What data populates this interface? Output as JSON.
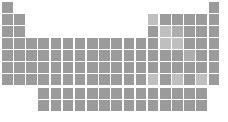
{
  "figure": {
    "name": "periodic-table-silhouette",
    "width": 228,
    "height": 122,
    "background_color": "#ffffff"
  },
  "palette": {
    "cell_default": "#9b9b9b",
    "cell_light": "#bfbfbf",
    "cell_mid": "#adadad",
    "cell_dark": "#8e8e8e",
    "background": "#ffffff"
  },
  "geometry": {
    "cell_size": 10.6,
    "cell_pitch_x": 12.15,
    "cell_pitch_y": 12.0,
    "origin_x": 2,
    "origin_y": 2,
    "f_block_origin_y": 88,
    "f_block_start_group": 4,
    "groups": 18,
    "periods": 7,
    "f_block_rows": 2,
    "f_block_columns": 14
  },
  "chart_data": {
    "type": "heatmap",
    "title": "",
    "xlabel": "",
    "ylabel": "",
    "grid": false,
    "legend": "none",
    "main_block": {
      "rows": [
        {
          "period": 1,
          "occupied_groups": [
            1,
            18
          ]
        },
        {
          "period": 2,
          "occupied_groups": [
            1,
            2,
            13,
            14,
            15,
            16,
            17,
            18
          ]
        },
        {
          "period": 3,
          "occupied_groups": [
            1,
            2,
            13,
            14,
            15,
            16,
            17,
            18
          ]
        },
        {
          "period": 4,
          "occupied_groups": [
            1,
            2,
            3,
            4,
            5,
            6,
            7,
            8,
            9,
            10,
            11,
            12,
            13,
            14,
            15,
            16,
            17,
            18
          ]
        },
        {
          "period": 5,
          "occupied_groups": [
            1,
            2,
            3,
            4,
            5,
            6,
            7,
            8,
            9,
            10,
            11,
            12,
            13,
            14,
            15,
            16,
            17,
            18
          ]
        },
        {
          "period": 6,
          "occupied_groups": [
            1,
            2,
            3,
            4,
            5,
            6,
            7,
            8,
            9,
            10,
            11,
            12,
            13,
            14,
            15,
            16,
            17,
            18
          ]
        },
        {
          "period": 7,
          "occupied_groups": [
            1,
            2,
            3,
            4,
            5,
            6,
            7,
            8,
            9,
            10,
            11,
            12,
            13,
            14,
            15,
            16,
            17,
            18
          ]
        }
      ]
    },
    "f_block": {
      "rows": [
        {
          "series": "lanthanides",
          "columns": 14
        },
        {
          "series": "actinides",
          "columns": 14
        }
      ]
    },
    "cells": [
      {
        "row": 1,
        "col": 1,
        "shade": "default"
      },
      {
        "row": 1,
        "col": 18,
        "shade": "default"
      },
      {
        "row": 2,
        "col": 1,
        "shade": "default"
      },
      {
        "row": 2,
        "col": 2,
        "shade": "default"
      },
      {
        "row": 2,
        "col": 13,
        "shade": "light"
      },
      {
        "row": 2,
        "col": 14,
        "shade": "default"
      },
      {
        "row": 2,
        "col": 15,
        "shade": "default"
      },
      {
        "row": 2,
        "col": 16,
        "shade": "default"
      },
      {
        "row": 2,
        "col": 17,
        "shade": "default"
      },
      {
        "row": 2,
        "col": 18,
        "shade": "default"
      },
      {
        "row": 3,
        "col": 1,
        "shade": "default"
      },
      {
        "row": 3,
        "col": 2,
        "shade": "default"
      },
      {
        "row": 3,
        "col": 13,
        "shade": "default"
      },
      {
        "row": 3,
        "col": 14,
        "shade": "light"
      },
      {
        "row": 3,
        "col": 15,
        "shade": "mid"
      },
      {
        "row": 3,
        "col": 16,
        "shade": "default"
      },
      {
        "row": 3,
        "col": 17,
        "shade": "default"
      },
      {
        "row": 3,
        "col": 18,
        "shade": "default"
      },
      {
        "row": 4,
        "col": 1,
        "shade": "default"
      },
      {
        "row": 4,
        "col": 2,
        "shade": "default"
      },
      {
        "row": 4,
        "col": 3,
        "shade": "default"
      },
      {
        "row": 4,
        "col": 4,
        "shade": "default"
      },
      {
        "row": 4,
        "col": 5,
        "shade": "default"
      },
      {
        "row": 4,
        "col": 6,
        "shade": "default"
      },
      {
        "row": 4,
        "col": 7,
        "shade": "default"
      },
      {
        "row": 4,
        "col": 8,
        "shade": "default"
      },
      {
        "row": 4,
        "col": 9,
        "shade": "default"
      },
      {
        "row": 4,
        "col": 10,
        "shade": "default"
      },
      {
        "row": 4,
        "col": 11,
        "shade": "default"
      },
      {
        "row": 4,
        "col": 12,
        "shade": "default"
      },
      {
        "row": 4,
        "col": 13,
        "shade": "default"
      },
      {
        "row": 4,
        "col": 14,
        "shade": "light"
      },
      {
        "row": 4,
        "col": 15,
        "shade": "light"
      },
      {
        "row": 4,
        "col": 16,
        "shade": "default"
      },
      {
        "row": 4,
        "col": 17,
        "shade": "default"
      },
      {
        "row": 4,
        "col": 18,
        "shade": "default"
      },
      {
        "row": 5,
        "col": 1,
        "shade": "default"
      },
      {
        "row": 5,
        "col": 2,
        "shade": "default"
      },
      {
        "row": 5,
        "col": 3,
        "shade": "default"
      },
      {
        "row": 5,
        "col": 4,
        "shade": "default"
      },
      {
        "row": 5,
        "col": 5,
        "shade": "default"
      },
      {
        "row": 5,
        "col": 6,
        "shade": "default"
      },
      {
        "row": 5,
        "col": 7,
        "shade": "default"
      },
      {
        "row": 5,
        "col": 8,
        "shade": "default"
      },
      {
        "row": 5,
        "col": 9,
        "shade": "default"
      },
      {
        "row": 5,
        "col": 10,
        "shade": "default"
      },
      {
        "row": 5,
        "col": 11,
        "shade": "default"
      },
      {
        "row": 5,
        "col": 12,
        "shade": "default"
      },
      {
        "row": 5,
        "col": 13,
        "shade": "default"
      },
      {
        "row": 5,
        "col": 14,
        "shade": "default"
      },
      {
        "row": 5,
        "col": 15,
        "shade": "default"
      },
      {
        "row": 5,
        "col": 16,
        "shade": "mid"
      },
      {
        "row": 5,
        "col": 17,
        "shade": "default"
      },
      {
        "row": 5,
        "col": 18,
        "shade": "default"
      },
      {
        "row": 6,
        "col": 1,
        "shade": "default"
      },
      {
        "row": 6,
        "col": 2,
        "shade": "default"
      },
      {
        "row": 6,
        "col": 3,
        "shade": "default"
      },
      {
        "row": 6,
        "col": 4,
        "shade": "default"
      },
      {
        "row": 6,
        "col": 5,
        "shade": "default"
      },
      {
        "row": 6,
        "col": 6,
        "shade": "default"
      },
      {
        "row": 6,
        "col": 7,
        "shade": "default"
      },
      {
        "row": 6,
        "col": 8,
        "shade": "default"
      },
      {
        "row": 6,
        "col": 9,
        "shade": "default"
      },
      {
        "row": 6,
        "col": 10,
        "shade": "default"
      },
      {
        "row": 6,
        "col": 11,
        "shade": "default"
      },
      {
        "row": 6,
        "col": 12,
        "shade": "default"
      },
      {
        "row": 6,
        "col": 13,
        "shade": "default"
      },
      {
        "row": 6,
        "col": 14,
        "shade": "default"
      },
      {
        "row": 6,
        "col": 15,
        "shade": "default"
      },
      {
        "row": 6,
        "col": 16,
        "shade": "default"
      },
      {
        "row": 6,
        "col": 17,
        "shade": "default"
      },
      {
        "row": 6,
        "col": 18,
        "shade": "default"
      },
      {
        "row": 7,
        "col": 1,
        "shade": "default"
      },
      {
        "row": 7,
        "col": 2,
        "shade": "default"
      },
      {
        "row": 7,
        "col": 3,
        "shade": "default"
      },
      {
        "row": 7,
        "col": 4,
        "shade": "default"
      },
      {
        "row": 7,
        "col": 5,
        "shade": "default"
      },
      {
        "row": 7,
        "col": 6,
        "shade": "default"
      },
      {
        "row": 7,
        "col": 7,
        "shade": "default"
      },
      {
        "row": 7,
        "col": 8,
        "shade": "default"
      },
      {
        "row": 7,
        "col": 9,
        "shade": "default"
      },
      {
        "row": 7,
        "col": 10,
        "shade": "default"
      },
      {
        "row": 7,
        "col": 11,
        "shade": "default"
      },
      {
        "row": 7,
        "col": 12,
        "shade": "default"
      },
      {
        "row": 7,
        "col": 13,
        "shade": "light"
      },
      {
        "row": 7,
        "col": 14,
        "shade": "default"
      },
      {
        "row": 7,
        "col": 15,
        "shade": "light"
      },
      {
        "row": 7,
        "col": 16,
        "shade": "default"
      },
      {
        "row": 7,
        "col": 17,
        "shade": "light"
      },
      {
        "row": 7,
        "col": 18,
        "shade": "default"
      }
    ],
    "f_cells": [
      {
        "row": 1,
        "col": 1,
        "shade": "default"
      },
      {
        "row": 1,
        "col": 2,
        "shade": "default"
      },
      {
        "row": 1,
        "col": 3,
        "shade": "default"
      },
      {
        "row": 1,
        "col": 4,
        "shade": "default"
      },
      {
        "row": 1,
        "col": 5,
        "shade": "default"
      },
      {
        "row": 1,
        "col": 6,
        "shade": "default"
      },
      {
        "row": 1,
        "col": 7,
        "shade": "default"
      },
      {
        "row": 1,
        "col": 8,
        "shade": "default"
      },
      {
        "row": 1,
        "col": 9,
        "shade": "default"
      },
      {
        "row": 1,
        "col": 10,
        "shade": "default"
      },
      {
        "row": 1,
        "col": 11,
        "shade": "default"
      },
      {
        "row": 1,
        "col": 12,
        "shade": "default"
      },
      {
        "row": 1,
        "col": 13,
        "shade": "default"
      },
      {
        "row": 1,
        "col": 14,
        "shade": "default"
      },
      {
        "row": 2,
        "col": 1,
        "shade": "default"
      },
      {
        "row": 2,
        "col": 2,
        "shade": "default"
      },
      {
        "row": 2,
        "col": 3,
        "shade": "default"
      },
      {
        "row": 2,
        "col": 4,
        "shade": "default"
      },
      {
        "row": 2,
        "col": 5,
        "shade": "default"
      },
      {
        "row": 2,
        "col": 6,
        "shade": "default"
      },
      {
        "row": 2,
        "col": 7,
        "shade": "default"
      },
      {
        "row": 2,
        "col": 8,
        "shade": "default"
      },
      {
        "row": 2,
        "col": 9,
        "shade": "default"
      },
      {
        "row": 2,
        "col": 10,
        "shade": "default"
      },
      {
        "row": 2,
        "col": 11,
        "shade": "default"
      },
      {
        "row": 2,
        "col": 12,
        "shade": "default"
      },
      {
        "row": 2,
        "col": 13,
        "shade": "default"
      },
      {
        "row": 2,
        "col": 14,
        "shade": "default"
      }
    ]
  }
}
